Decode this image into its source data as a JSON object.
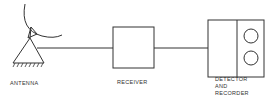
{
  "diagram": {
    "type": "block-diagram",
    "components": [
      {
        "id": "antenna",
        "label": "ANTENNA",
        "icon": "antenna-dish-icon"
      },
      {
        "id": "receiver",
        "label": "RECEIVER",
        "icon": "box"
      },
      {
        "id": "detector",
        "label_lines": [
          "DETECTOR",
          "AND",
          "RECORDER"
        ],
        "icon": "two-dial-box"
      }
    ],
    "connections": [
      {
        "from": "antenna",
        "to": "receiver"
      },
      {
        "from": "receiver",
        "to": "detector"
      }
    ],
    "colors": {
      "stroke": "#333333",
      "background": "#ffffff",
      "text": "#333333"
    }
  }
}
